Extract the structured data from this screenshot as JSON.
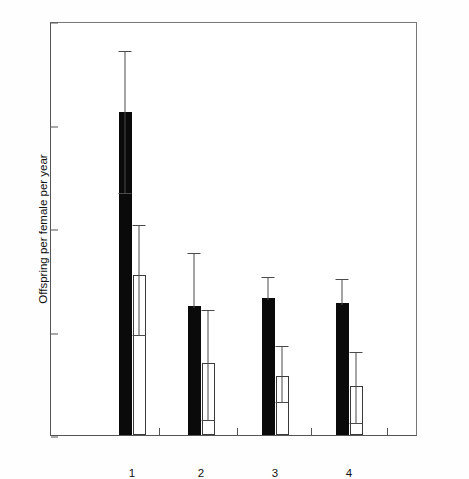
{
  "chart_data": {
    "type": "bar",
    "title": "",
    "xlabel": "Rank",
    "ylabel": "Offspring per female per year",
    "categories": [
      "1",
      "2",
      "3",
      "4"
    ],
    "ylim": [
      0.0,
      0.8
    ],
    "yticks": [
      "0.0",
      "0.2",
      "0.4",
      "0.6",
      "0.8"
    ],
    "ytick_values": [
      0.0,
      0.2,
      0.4,
      0.6,
      0.8
    ],
    "grid": false,
    "legend": "none",
    "series": [
      {
        "name": "filled",
        "fill": "#0a0a0a",
        "values": [
          0.625,
          0.25,
          0.265,
          0.255
        ],
        "err_low": [
          0.47,
          0.25,
          0.265,
          0.255
        ],
        "err_high": [
          0.745,
          0.355,
          0.31,
          0.305
        ]
      },
      {
        "name": "open",
        "fill": "#ffffff",
        "values": [
          0.31,
          0.14,
          0.115,
          0.095
        ],
        "err_low": [
          0.195,
          0.03,
          0.065,
          0.025
        ],
        "err_high": [
          0.41,
          0.245,
          0.175,
          0.165
        ]
      }
    ]
  },
  "axis": {
    "y_label": "Offspring per female per year",
    "x_label": "Rank",
    "y_ticks": [
      "0.0",
      "0.2",
      "0.4",
      "0.6",
      "0.8"
    ],
    "x_ticks": [
      "1",
      "2",
      "3",
      "4"
    ]
  },
  "colors": {
    "filled_bar": "#0a0a0a",
    "open_bar": "#ffffff",
    "axis": "#555555",
    "error_bar": "#4a4a4a",
    "background": "#ffffff"
  }
}
